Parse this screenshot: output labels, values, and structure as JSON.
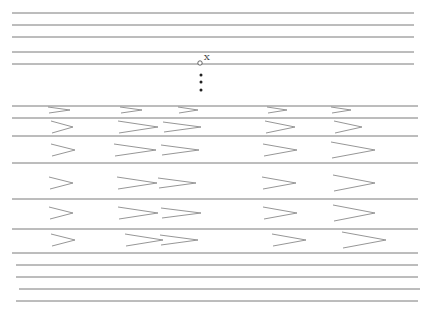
{
  "diagram": {
    "type": "layered-line-schematic",
    "colors": {
      "line": "#7a7a7a",
      "chevron": "#8a8a8a",
      "marker": "#444444",
      "dot": "#222222"
    },
    "marker_label": "X",
    "continuation_dots": 3,
    "upper_layer_count": 5,
    "middle_layer_count": 7,
    "lower_layer_count": 5,
    "chevron_rows": [
      {
        "columns": [
          "single",
          "single",
          "single",
          "single",
          "single"
        ]
      },
      {
        "columns": [
          "single",
          "single",
          "single",
          "single",
          "single"
        ]
      },
      {
        "columns": [
          "single",
          "double",
          "single",
          "single"
        ]
      },
      {
        "columns": [
          "single",
          "double",
          "single",
          "single"
        ]
      },
      {
        "columns": [
          "single",
          "double",
          "single",
          "single"
        ]
      },
      {
        "columns": [
          "single",
          "double",
          "single",
          "single"
        ]
      }
    ]
  }
}
